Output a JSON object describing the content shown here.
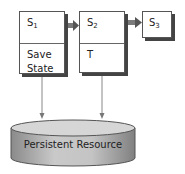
{
  "diagram": {
    "states": [
      {
        "id": "s1",
        "name": "S",
        "sub": "1",
        "body": [
          "Save",
          "State"
        ]
      },
      {
        "id": "s2",
        "name": "S",
        "sub": "2",
        "body": [
          "T"
        ]
      },
      {
        "id": "s3",
        "name": "S",
        "sub": "3",
        "body": []
      }
    ],
    "resource": {
      "label": "Persistent Resource"
    },
    "edges": [
      {
        "from": "s1",
        "to": "s2",
        "type": "transition"
      },
      {
        "from": "s2",
        "to": "s3",
        "type": "transition"
      },
      {
        "from": "s1",
        "to": "resource",
        "type": "write"
      },
      {
        "from": "s2",
        "to": "resource",
        "type": "write"
      }
    ],
    "colors": {
      "border": "#555555",
      "shadow": "#444444",
      "arrow": "#777777",
      "cylinder": "#b8b8b8"
    }
  }
}
